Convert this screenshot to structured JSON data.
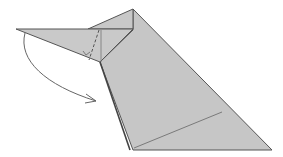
{
  "diagram": {
    "type": "origami-fold-step",
    "colors": {
      "paper": "#c8c8c8",
      "paper_dark": "#bdbdbd",
      "edge": "#555555",
      "crease": "#7a7a7a",
      "arrow": "#666666",
      "background": "#ffffff"
    },
    "elements": {
      "flap_label": "flap",
      "body_label": "body",
      "arrow_label": "fold-down arrow",
      "valley_fold_label": "valley fold line",
      "crease_label": "crease line",
      "right_angle_label": "right-angle mark"
    }
  }
}
